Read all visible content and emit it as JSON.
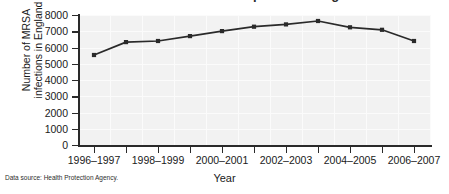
{
  "chart_data": {
    "type": "line",
    "title": "Number of MRSA infections reported in England",
    "xlabel": "Year",
    "ylabel_line1": "Number of MRSA",
    "ylabel_line2": "infections in England",
    "categories": [
      "1996–1997",
      "1997–1998",
      "1998–1999",
      "1999–2000",
      "2000–2001",
      "2001–2002",
      "2002–2003",
      "2003–2004",
      "2004–2005",
      "2005–2006",
      "2006–2007"
    ],
    "values": [
      5540,
      6330,
      6400,
      6700,
      7010,
      7280,
      7420,
      7630,
      7240,
      7090,
      6400
    ],
    "ylim": [
      0,
      8000
    ],
    "ytick_labels": [
      "8000",
      "7000",
      "6000",
      "5000",
      "4000",
      "3000",
      "2000",
      "1000",
      "0"
    ],
    "ytick_values": [
      8000,
      7000,
      6000,
      5000,
      4000,
      3000,
      2000,
      1000,
      0
    ],
    "xtick_labels_visible": [
      "1996–1997",
      "1998–1999",
      "2000–2001",
      "2002–2003",
      "2004–2005",
      "2006–2007"
    ],
    "grid": true,
    "legend": "none",
    "marker": "square",
    "line_color": "#2a2a2a",
    "plot_background": "#f2f2f2"
  },
  "caption": {
    "source": "Data source: Health Protection Agency."
  }
}
